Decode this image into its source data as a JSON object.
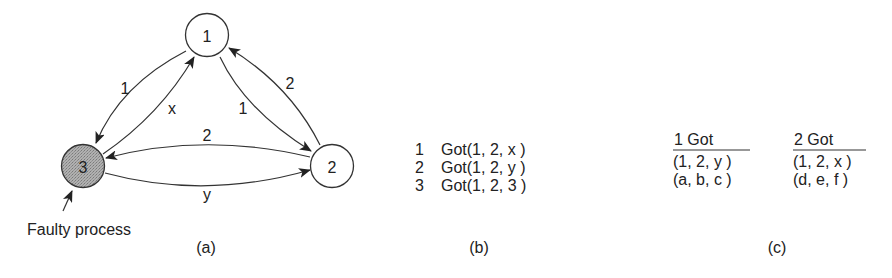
{
  "panel_a": {
    "caption": "(a)",
    "nodes": [
      {
        "id": "1",
        "label": "1",
        "faulty": false
      },
      {
        "id": "2",
        "label": "2",
        "faulty": false
      },
      {
        "id": "3",
        "label": "3",
        "faulty": true
      }
    ],
    "edges": [
      {
        "from": "1",
        "to": "3",
        "label": "1"
      },
      {
        "from": "3",
        "to": "1",
        "label": "x"
      },
      {
        "from": "1",
        "to": "2",
        "label": "1"
      },
      {
        "from": "2",
        "to": "1",
        "label": "2"
      },
      {
        "from": "2",
        "to": "3",
        "label": "2"
      },
      {
        "from": "3",
        "to": "2",
        "label": "y"
      }
    ],
    "annotation": "Faulty process",
    "colors": {
      "faulty_fill": "#a9a9a9",
      "normal_fill": "#ffffff",
      "stroke": "#333333"
    }
  },
  "panel_b": {
    "caption": "(b)",
    "rows": [
      {
        "process": "1",
        "text": "Got(1, 2, x )"
      },
      {
        "process": "2",
        "text": "Got(1, 2, y )"
      },
      {
        "process": "3",
        "text": "Got(1, 2, 3 )"
      }
    ]
  },
  "panel_c": {
    "caption": "(c)",
    "columns": [
      {
        "header": "1 Got",
        "rows": [
          "(1, 2,  y )",
          "(a, b,  c )"
        ]
      },
      {
        "header": "2 Got",
        "rows": [
          "(1, 2,  x )",
          "(d, e, f  )"
        ]
      }
    ]
  }
}
